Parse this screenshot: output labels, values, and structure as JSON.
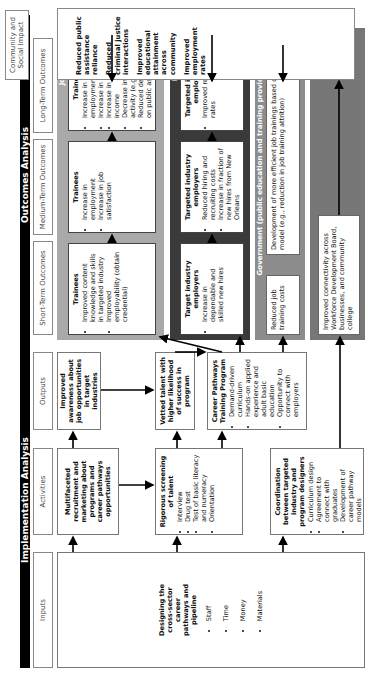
{
  "headers": {
    "implementation": "Implementation Analysis",
    "outcomes": "Outcomes Analysis"
  },
  "columns": {
    "inputs": "Inputs",
    "activities": "Activities",
    "outputs": "Outputs",
    "short_term": "Short-Term Outcomes",
    "medium_term": "Medium-Term Outcomes",
    "long_term": "Long-Term Outcomes",
    "community": "Community and Social Impact"
  },
  "inputs": {
    "title": "Designing the cross-sector career pathways and pipeline",
    "items": [
      "Staff",
      "Time",
      "Money",
      "Materials"
    ]
  },
  "activities": [
    {
      "title": "Multifaceted recruitment and marketing about programs and career pathways opportunities",
      "items": []
    },
    {
      "title": "Rigorous screening of talent",
      "items": [
        "Interview",
        "Drug test",
        "Test of basic literacy and numeracy",
        "Orientation"
      ]
    },
    {
      "title": "Coordination between targeted industry and program designers",
      "items": [
        "Curriculum design",
        "Agreement to connect with graduates",
        "Development of career pathway models"
      ]
    }
  ],
  "outputs": [
    {
      "title": "Improved awareness about job opportunities in target industries",
      "items": []
    },
    {
      "title": "Vetted talent with higher likelihood of success in program",
      "items": []
    },
    {
      "title": "Career Pathways Training Program",
      "items": [
        "Demand-driven curriculum",
        "Hands-on applied experience and adult basic education",
        "Opportunity to connect with employers"
      ]
    }
  ],
  "bands": {
    "job_seekers": {
      "label": "Job seekers",
      "short": {
        "title": "Trainees",
        "items": [
          "Improved content knowledge and skills in targeted industry",
          "Improved employability (obtain credential)"
        ]
      },
      "medium": {
        "title": "Trainees",
        "items": [
          "Increase in employment",
          "Increase in job satisfaction"
        ]
      },
      "long": {
        "title": "Trainees",
        "items": [
          "Increase in employment stability",
          "Increase in retention",
          "Increase in wages and income",
          "Decrease in illicit activity (e.g., arrests)",
          "Reduced dependence on public assistance"
        ]
      }
    },
    "employers": {
      "label": "Employers",
      "short": {
        "title": "Target industry employers",
        "items": [
          "Increase in dependable and skilled new hires"
        ]
      },
      "medium": {
        "title": "Targeted industry employers",
        "items": [
          "Reduced hiring and recruiting costs",
          "Increase in fraction of new hires from New Orleans"
        ]
      },
      "long": {
        "title": "Targeted industry employers",
        "items": [
          "Improved retention rates"
        ]
      }
    },
    "government": {
      "label": "Government (public education and training providers/WDB)",
      "short": "Reduced job training costs",
      "medium_long": "Development of more efficient job trainings based on this model (e.g., reduction in job training attrition)"
    },
    "system": {
      "label": "System",
      "short": "Improved connectivity across Workforce Development Board, businesses, and community college"
    }
  },
  "community": [
    "Reduced public assistance reliance",
    "Reduced criminal justice interactions",
    "Improved educational attainment across community",
    "Improved employment rates"
  ]
}
